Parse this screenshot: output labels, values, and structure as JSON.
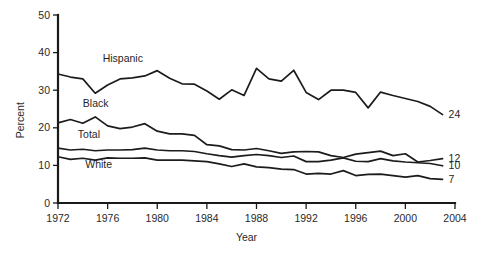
{
  "chart_data": {
    "type": "line",
    "title": "",
    "xlabel": "Year",
    "ylabel": "Percent",
    "xlim": [
      1972,
      2004
    ],
    "ylim": [
      0,
      50
    ],
    "grid": false,
    "legend_position": "inline-labels",
    "xticks": [
      "1972",
      "1976",
      "1980",
      "1984",
      "1988",
      "1992",
      "1996",
      "2000",
      "2004"
    ],
    "xtick_values": [
      1972,
      1976,
      1980,
      1984,
      1988,
      1992,
      1996,
      2000,
      2004
    ],
    "yticks": [
      "0",
      "10",
      "20",
      "30",
      "40",
      "50"
    ],
    "ytick_values": [
      0,
      10,
      20,
      30,
      40,
      50
    ],
    "x": [
      1972,
      1973,
      1974,
      1975,
      1976,
      1977,
      1978,
      1979,
      1980,
      1981,
      1982,
      1983,
      1984,
      1985,
      1986,
      1987,
      1988,
      1989,
      1990,
      1991,
      1992,
      1993,
      1994,
      1995,
      1996,
      1997,
      1998,
      1999,
      2000,
      2001,
      2002,
      2003
    ],
    "series": [
      {
        "name": "Hispanic",
        "label": "Hispanic",
        "end_label": "24",
        "end_value": 24,
        "values": [
          34.3,
          33.5,
          33.0,
          29.2,
          31.4,
          33.0,
          33.3,
          33.8,
          35.2,
          33.2,
          31.7,
          31.6,
          29.8,
          27.6,
          30.1,
          28.6,
          35.8,
          33.0,
          32.4,
          35.3,
          29.4,
          27.5,
          30.0,
          30.0,
          29.4,
          25.3,
          29.5,
          28.6,
          27.8,
          27.0,
          25.7,
          23.5
        ]
      },
      {
        "name": "Black",
        "label": "Black",
        "end_label": "12",
        "end_value": 12,
        "values": [
          21.3,
          22.2,
          21.2,
          22.9,
          20.5,
          19.8,
          20.2,
          21.1,
          19.1,
          18.4,
          18.4,
          18.0,
          15.5,
          15.2,
          14.2,
          14.1,
          14.5,
          13.9,
          13.2,
          13.6,
          13.7,
          13.6,
          12.6,
          12.1,
          13.0,
          13.4,
          13.8,
          12.6,
          13.1,
          10.9,
          11.3,
          11.8
        ]
      },
      {
        "name": "Total",
        "label": "Total",
        "end_label": "10",
        "end_value": 10,
        "values": [
          14.6,
          14.1,
          14.3,
          13.9,
          14.1,
          14.1,
          14.2,
          14.6,
          14.1,
          13.9,
          13.9,
          13.7,
          13.1,
          12.6,
          12.2,
          12.6,
          12.9,
          12.6,
          12.1,
          12.5,
          11.0,
          11.0,
          11.4,
          12.0,
          11.1,
          11.0,
          11.8,
          11.2,
          10.9,
          10.7,
          10.5,
          9.9
        ]
      },
      {
        "name": "White",
        "label": "White",
        "end_label": "7",
        "end_value": 7,
        "values": [
          12.3,
          11.6,
          11.9,
          11.4,
          12.0,
          11.9,
          11.9,
          12.0,
          11.4,
          11.4,
          11.4,
          11.2,
          11.0,
          10.4,
          9.7,
          10.4,
          9.6,
          9.4,
          9.0,
          8.9,
          7.7,
          7.9,
          7.7,
          8.6,
          7.3,
          7.6,
          7.7,
          7.3,
          6.9,
          7.3,
          6.5,
          6.3
        ]
      }
    ],
    "annotations": [
      {
        "name": "hispanic-inline-label",
        "text": "Hispanic",
        "x": 1975.6,
        "y": 37.5
      },
      {
        "name": "black-inline-label",
        "text": "Black",
        "x": 1974.0,
        "y": 25.5
      },
      {
        "name": "total-inline-label",
        "text": "Total",
        "x": 1973.6,
        "y": 17.3
      },
      {
        "name": "white-inline-label",
        "text": "White",
        "x": 1974.2,
        "y": 9.3
      }
    ],
    "colors": {
      "line": "#1c1c1c",
      "axis": "#1a1a1a",
      "text": "#2a2a2a",
      "background": "#ffffff"
    }
  }
}
